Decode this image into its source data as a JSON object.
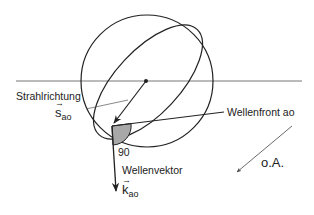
{
  "diagram": {
    "labels": {
      "ray_direction": "Strahlrichtung",
      "ray_vector_symbol": "s",
      "ray_vector_sub": "ao",
      "wavefront": "Wellenfront ao",
      "angle": "90",
      "wave_vector": "Wellenvektor",
      "wave_vector_symbol": "k",
      "wave_vector_sub": "ao",
      "optical_axis": "o.A.",
      "vector_arrow": "→"
    },
    "colors": {
      "line": "#222222",
      "thin_line": "#555555",
      "angle_fill": "#a8a8a8"
    }
  }
}
